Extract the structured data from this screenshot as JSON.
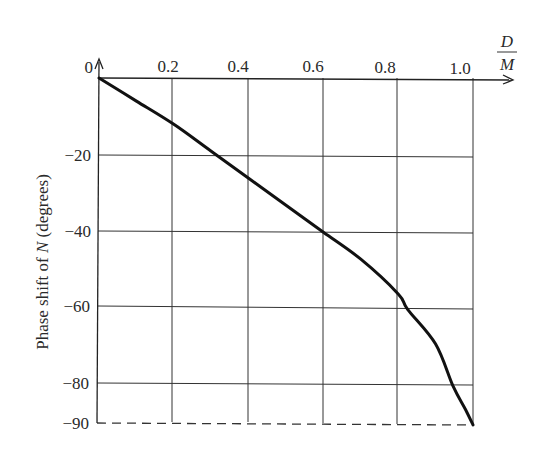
{
  "chart_data": {
    "type": "line",
    "title": "",
    "xlabel": "D/M",
    "xlabel_numerator": "D",
    "xlabel_denominator": "M",
    "ylabel": "Phase shift of N (degrees)",
    "ylabel_parts": [
      "Phase shift of ",
      "N",
      " (degrees)"
    ],
    "xlim": [
      0,
      1.0
    ],
    "ylim": [
      -90,
      0
    ],
    "grid": true,
    "x_ticks": [
      0.2,
      0.4,
      0.6,
      0.8,
      1.0
    ],
    "x_tick_labels": [
      "0.2",
      "0.4",
      "0.6",
      "0.8",
      "1.0"
    ],
    "y_ticks": [
      0,
      -20,
      -40,
      -60,
      -80,
      -90
    ],
    "y_tick_labels": [
      "0",
      "−20",
      "−40",
      "−60",
      "−80",
      "−90"
    ],
    "annotations": [
      "dashed horizontal line at -90 degrees"
    ],
    "series": [
      {
        "name": "Phase shift of N",
        "x": [
          0.0,
          0.1,
          0.2,
          0.3,
          0.4,
          0.5,
          0.6,
          0.7,
          0.8,
          0.825,
          0.9,
          0.947,
          0.98,
          1.0
        ],
        "y": [
          0,
          -6,
          -12,
          -19,
          -26,
          -33,
          -40,
          -47,
          -56,
          -60,
          -69,
          -80,
          -86,
          -90
        ]
      }
    ]
  }
}
